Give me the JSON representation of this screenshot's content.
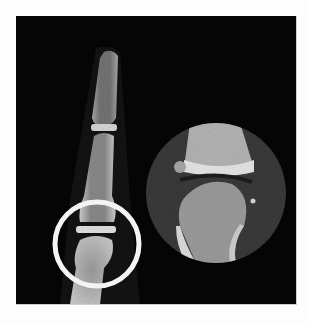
{
  "figure": {
    "colors": {
      "background": "#fdfdfd",
      "panel": "#050505",
      "highlight_ring": "#f4f4f4",
      "bone": "#bdbdbd",
      "inset_background": "#3a3a3a"
    },
    "annotation": {
      "type": "circle",
      "center": [
        97,
        244
      ],
      "radius": 42
    },
    "inset": {
      "type": "magnified-circle",
      "center": [
        216,
        193
      ],
      "radius": 70
    }
  }
}
